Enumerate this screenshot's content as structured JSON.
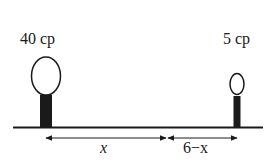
{
  "diagram": {
    "lamps": [
      {
        "label": "40 cp",
        "size": "large"
      },
      {
        "label": "5 cp",
        "size": "small"
      }
    ],
    "distances": [
      {
        "label": "x"
      },
      {
        "label": "6−x"
      }
    ],
    "colors": {
      "ink": "#1a1a1a",
      "background": "#ffffff"
    }
  }
}
